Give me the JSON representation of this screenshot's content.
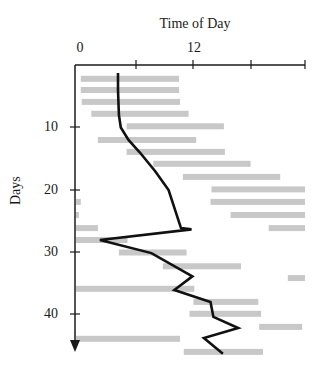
{
  "chart_data": {
    "type": "bar",
    "subtype": "floating-horizontal-bars-with-line",
    "title": "Time of Day",
    "xlabel": "Time of Day",
    "ylabel": "Days",
    "xlim": [
      0,
      24
    ],
    "ylim": [
      0,
      47
    ],
    "x_ticks": [
      0,
      6,
      12,
      18,
      24
    ],
    "x_tick_labels": [
      "0",
      "12"
    ],
    "x_tick_label_values": [
      0,
      12
    ],
    "y_ticks": [
      10,
      20,
      30,
      40
    ],
    "y_tick_labels": [
      "10",
      "20",
      "30",
      "40"
    ],
    "y_axis_inverted": true,
    "grid": false,
    "legend": null,
    "bar_color": "#c8c8c8",
    "line_color": "#111111",
    "bars": [
      {
        "day": 2.2,
        "segments": [
          [
            0.5,
            10.8
          ]
        ]
      },
      {
        "day": 4.0,
        "segments": [
          [
            0.5,
            10.8
          ]
        ]
      },
      {
        "day": 5.9,
        "segments": [
          [
            0.6,
            10.9
          ]
        ]
      },
      {
        "day": 7.8,
        "segments": [
          [
            1.6,
            11.8
          ]
        ]
      },
      {
        "day": 9.8,
        "segments": [
          [
            5.3,
            15.5
          ]
        ]
      },
      {
        "day": 12.0,
        "segments": [
          [
            2.3,
            12.6
          ]
        ]
      },
      {
        "day": 13.9,
        "segments": [
          [
            5.3,
            15.6
          ]
        ]
      },
      {
        "day": 15.8,
        "segments": [
          [
            8.1,
            18.3
          ]
        ]
      },
      {
        "day": 17.9,
        "segments": [
          [
            11.2,
            21.4
          ]
        ]
      },
      {
        "day": 19.9,
        "segments": [
          [
            14.2,
            24
          ]
        ]
      },
      {
        "day": 21.9,
        "segments": [
          [
            0,
            0.5
          ],
          [
            14.1,
            24
          ]
        ]
      },
      {
        "day": 24.0,
        "segments": [
          [
            0,
            0.3
          ],
          [
            16.2,
            24
          ]
        ]
      },
      {
        "day": 26.1,
        "segments": [
          [
            0,
            2.3
          ],
          [
            20.2,
            24
          ]
        ]
      },
      {
        "day": 28.0,
        "segments": [
          [
            0,
            5.4
          ]
        ]
      },
      {
        "day": 30.0,
        "segments": [
          [
            4.5,
            11.6
          ]
        ]
      },
      {
        "day": 32.2,
        "segments": [
          [
            9.1,
            17.3
          ]
        ]
      },
      {
        "day": 34.1,
        "segments": [
          [
            22.2,
            24
          ]
        ]
      },
      {
        "day": 35.8,
        "segments": [
          [
            0,
            12.4
          ]
        ]
      },
      {
        "day": 37.9,
        "segments": [
          [
            12.3,
            19.1
          ]
        ]
      },
      {
        "day": 39.8,
        "segments": [
          [
            11.9,
            19.4
          ]
        ]
      },
      {
        "day": 41.9,
        "segments": [
          [
            19.2,
            23.7
          ]
        ]
      },
      {
        "day": 43.8,
        "segments": [
          [
            0,
            10.9
          ]
        ]
      },
      {
        "day": 45.9,
        "segments": [
          [
            11.3,
            19.6
          ]
        ]
      }
    ],
    "line": {
      "name": "midpoint trend",
      "points": [
        [
          4.4,
          1.3
        ],
        [
          4.4,
          4.0
        ],
        [
          4.5,
          8.0
        ],
        [
          4.7,
          10.0
        ],
        [
          5.5,
          12.0
        ],
        [
          6.7,
          14.0
        ],
        [
          8.3,
          17.0
        ],
        [
          9.7,
          20.0
        ],
        [
          11.0,
          26.1
        ],
        [
          12.1,
          26.3
        ],
        [
          2.5,
          28.0
        ],
        [
          7.9,
          30.1
        ],
        [
          12.2,
          33.8
        ],
        [
          10.3,
          36.0
        ],
        [
          14.1,
          37.9
        ],
        [
          14.4,
          40.3
        ],
        [
          17.0,
          42.1
        ],
        [
          13.4,
          43.7
        ],
        [
          15.4,
          46.2
        ]
      ]
    }
  },
  "labels": {
    "title": "Time of Day",
    "ylabel": "Days",
    "x0": "0",
    "x12": "12",
    "y10": "10",
    "y20": "20",
    "y30": "30",
    "y40": "40"
  }
}
